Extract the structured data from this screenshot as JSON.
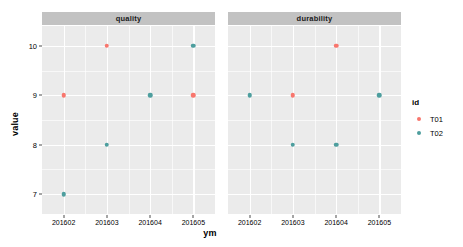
{
  "chart_data": {
    "type": "scatter",
    "title": "",
    "xlabel": "ym",
    "ylabel": "value",
    "categories": [
      "201602",
      "201603",
      "201604",
      "201605"
    ],
    "ylim": [
      6.6,
      10.4
    ],
    "yticks": [
      7,
      8,
      9,
      10
    ],
    "ytick_labels": [
      "7",
      "8",
      "9",
      "10"
    ],
    "y_minor_ticks": [
      7.5,
      8.5,
      9.5
    ],
    "grid": true,
    "legend": {
      "title": "id",
      "position": "right",
      "entries": [
        {
          "label": "T01",
          "color": "#f8766d"
        },
        {
          "label": "T02",
          "color": "#4d9e9e"
        }
      ]
    },
    "facet_variable": "variable",
    "facets": [
      {
        "label": "quality",
        "series": [
          {
            "name": "T01",
            "color": "#f8766d",
            "points": [
              {
                "x": "201602",
                "y": 9
              },
              {
                "x": "201603",
                "y": 10
              },
              {
                "x": "201605",
                "y": 9
              }
            ]
          },
          {
            "name": "T02",
            "color": "#4d9e9e",
            "points": [
              {
                "x": "201602",
                "y": 7
              },
              {
                "x": "201603",
                "y": 8
              },
              {
                "x": "201604",
                "y": 9
              },
              {
                "x": "201605",
                "y": 10
              }
            ]
          }
        ]
      },
      {
        "label": "durability",
        "series": [
          {
            "name": "T01",
            "color": "#f8766d",
            "points": [
              {
                "x": "201603",
                "y": 9
              },
              {
                "x": "201604",
                "y": 10
              }
            ]
          },
          {
            "name": "T02",
            "color": "#4d9e9e",
            "points": [
              {
                "x": "201602",
                "y": 9
              },
              {
                "x": "201603",
                "y": 8
              },
              {
                "x": "201604",
                "y": 8
              },
              {
                "x": "201605",
                "y": 9
              }
            ]
          }
        ]
      }
    ],
    "colors": {
      "panel_background": "#ebebeb",
      "strip_background": "#c2c2c2",
      "grid_line": "#ffffff",
      "plot_background": "#ffffff"
    }
  }
}
